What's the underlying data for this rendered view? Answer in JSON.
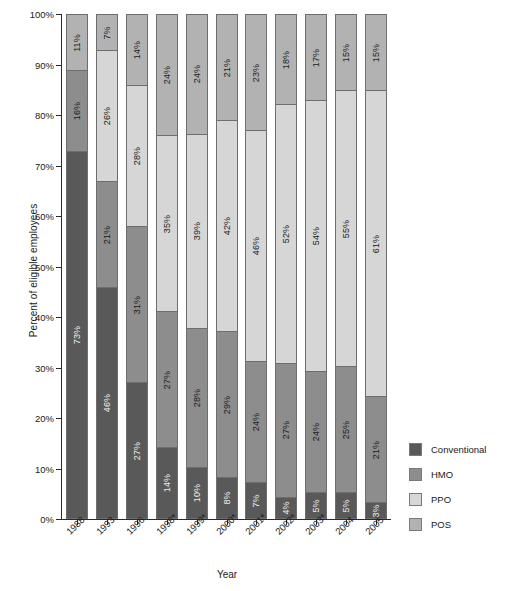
{
  "chart_data": {
    "type": "bar",
    "subtype": "stacked-bar-100-percent",
    "title": "",
    "xlabel": "Year",
    "ylabel": "Percent of eligible employees",
    "ylim": [
      0,
      100
    ],
    "y_ticks": [
      "0%",
      "10%",
      "20%",
      "30%",
      "40%",
      "50%",
      "60%",
      "70%",
      "80%",
      "90%",
      "100%"
    ],
    "grid": false,
    "legend_position": "right",
    "categories": [
      "1988",
      "1993",
      "1996",
      "1998*",
      "1999*",
      "2000*",
      "2001*",
      "2002*",
      "2003*",
      "2004",
      "2005"
    ],
    "series": [
      {
        "name": "Conventional",
        "color": "#595959",
        "values": [
          73,
          46,
          27,
          14,
          10,
          8,
          7,
          4,
          5,
          5,
          3
        ],
        "labels": [
          "73%",
          "46%",
          "27%",
          "14%",
          "10%",
          "8%",
          "7%",
          "4%",
          "5%",
          "5%",
          "3%"
        ]
      },
      {
        "name": "HMO",
        "color": "#8d8d8d",
        "values": [
          16,
          21,
          31,
          27,
          28,
          29,
          24,
          27,
          24,
          25,
          21
        ],
        "labels": [
          "16%",
          "21%",
          "31%",
          "27%",
          "28%",
          "29%",
          "24%",
          "27%",
          "24%",
          "25%",
          "21%"
        ]
      },
      {
        "name": "PPO",
        "color": "#d6d6d6",
        "values": [
          0,
          26,
          28,
          35,
          39,
          42,
          46,
          52,
          54,
          55,
          61
        ],
        "labels": [
          "",
          "26%",
          "28%",
          "35%",
          "39%",
          "42%",
          "46%",
          "52%",
          "54%",
          "55%",
          "61%"
        ]
      },
      {
        "name": "POS",
        "color": "#b2b2b2",
        "values": [
          11,
          7,
          14,
          24,
          24,
          21,
          23,
          18,
          17,
          15,
          15
        ],
        "labels": [
          "11%",
          "7%",
          "14%",
          "24%",
          "24%",
          "21%",
          "23%",
          "18%",
          "17%",
          "15%",
          "15%"
        ]
      }
    ]
  },
  "legend": {
    "items": [
      {
        "label": "Conventional",
        "color": "#595959"
      },
      {
        "label": "HMO",
        "color": "#8d8d8d"
      },
      {
        "label": "PPO",
        "color": "#d6d6d6"
      },
      {
        "label": "POS",
        "color": "#b2b2b2"
      }
    ]
  }
}
